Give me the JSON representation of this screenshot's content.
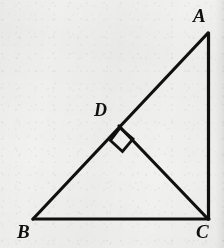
{
  "figure": {
    "kind": "geometry-diagram",
    "background_color": "#f1f1ef",
    "stroke_color": "#101010",
    "stroke_width": 3,
    "canvas": {
      "width": 224,
      "height": 248
    },
    "vertices": [
      {
        "id": "A",
        "label": "A",
        "x": 208,
        "y": 33,
        "label_x": 193,
        "label_y": 6
      },
      {
        "id": "B",
        "label": "B",
        "x": 33,
        "y": 219,
        "label_x": 17,
        "label_y": 222
      },
      {
        "id": "C",
        "label": "C",
        "x": 208,
        "y": 219,
        "label_x": 196,
        "label_y": 222
      },
      {
        "id": "D",
        "label": "D",
        "x": 120,
        "y": 127,
        "label_x": 94,
        "label_y": 101
      }
    ],
    "segments": [
      {
        "id": "AB",
        "from": "A",
        "to": "B",
        "name": "hypotenuse-ab"
      },
      {
        "id": "AC",
        "from": "A",
        "to": "C",
        "name": "side-ac"
      },
      {
        "id": "BC",
        "from": "B",
        "to": "C",
        "name": "base-bc"
      },
      {
        "id": "DC",
        "from": "D",
        "to": "C",
        "name": "altitude-dc"
      }
    ],
    "right_angle_marks": [
      {
        "id": "angle-BDC",
        "at": "D",
        "shape": "square",
        "points": "120,128 110.5,140.5 122.5,151.5 133,139",
        "name": "right-angle-marker-d"
      }
    ]
  }
}
